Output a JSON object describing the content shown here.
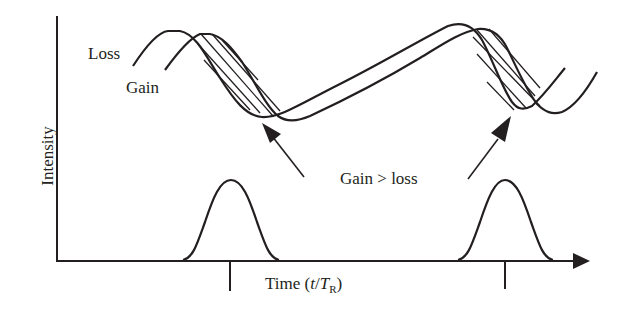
{
  "figure": {
    "labels": {
      "loss": "Loss",
      "gain": "Gain",
      "gain_gt_loss": "Gain > loss",
      "y_axis": "Intensity",
      "x_axis_prefix": "Time (",
      "x_axis_t": "t",
      "x_axis_slash": "/",
      "x_axis_T": "T",
      "x_axis_sub": "R",
      "x_axis_suffix": ")"
    },
    "colors": {
      "line": "#231f20",
      "background": "#ffffff"
    },
    "elements": {
      "curves": [
        "Loss",
        "Gain"
      ],
      "pulses": 2,
      "shaded_regions": 2,
      "arrows": 2,
      "tick_marks": 2
    }
  }
}
